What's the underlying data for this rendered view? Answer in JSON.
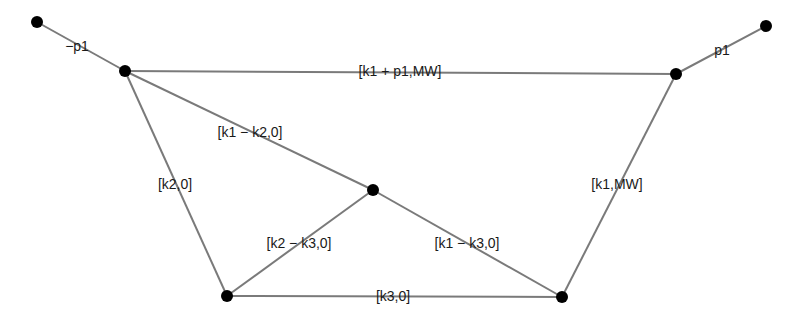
{
  "diagram": {
    "type": "graph",
    "colors": {
      "edge": "#7a7a7a",
      "node": "#000000",
      "label": "#1a1a1a",
      "background": "#ffffff"
    },
    "nodes": [
      {
        "id": "n_outer_left",
        "x": 37,
        "y": 22
      },
      {
        "id": "n_left",
        "x": 125,
        "y": 71
      },
      {
        "id": "n_right",
        "x": 676,
        "y": 74
      },
      {
        "id": "n_outer_right",
        "x": 766,
        "y": 26
      },
      {
        "id": "n_center",
        "x": 373,
        "y": 190
      },
      {
        "id": "n_bottom_left",
        "x": 227,
        "y": 296
      },
      {
        "id": "n_bottom_right",
        "x": 562,
        "y": 297
      }
    ],
    "edges": [
      {
        "from": "n_outer_left",
        "to": "n_left",
        "label": "−p1",
        "lx": 77,
        "ly": 47
      },
      {
        "from": "n_left",
        "to": "n_right",
        "label": "[k1 + p1,MW]",
        "lx": 400,
        "ly": 72
      },
      {
        "from": "n_right",
        "to": "n_outer_right",
        "label": "p1",
        "lx": 722,
        "ly": 51
      },
      {
        "from": "n_left",
        "to": "n_center",
        "label": "[k1 − k2,0]",
        "lx": 250,
        "ly": 133
      },
      {
        "from": "n_left",
        "to": "n_bottom_left",
        "label": "[k2,0]",
        "lx": 175,
        "ly": 185
      },
      {
        "from": "n_right",
        "to": "n_bottom_right",
        "label": "[k1,MW]",
        "lx": 617,
        "ly": 185
      },
      {
        "from": "n_center",
        "to": "n_bottom_left",
        "label": "[k2 − k3,0]",
        "lx": 299,
        "ly": 244
      },
      {
        "from": "n_center",
        "to": "n_bottom_right",
        "label": "[k1 − k3,0]",
        "lx": 467,
        "ly": 244
      },
      {
        "from": "n_bottom_left",
        "to": "n_bottom_right",
        "label": "[k3,0]",
        "lx": 393,
        "ly": 297
      }
    ]
  }
}
